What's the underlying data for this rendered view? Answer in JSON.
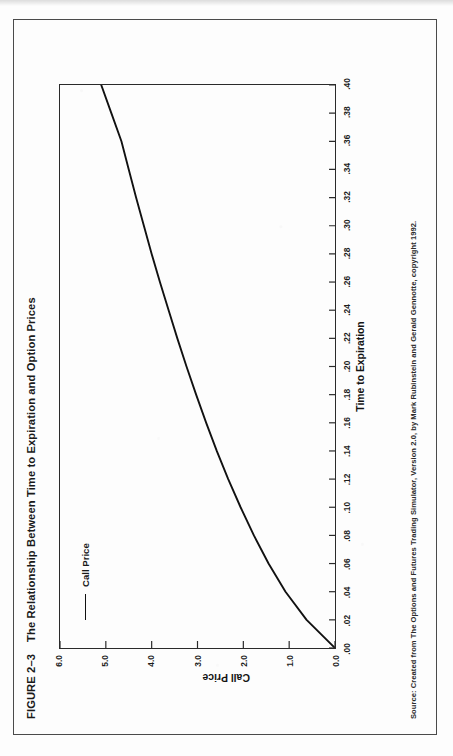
{
  "figure": {
    "number_label": "FIGURE 2–3",
    "title": "The Relationship Between Time to Expiration and Option Prices",
    "source_note": "Source: Created from The Options and Futures Trading Simulator, Version 2.0, by Mark Rubinstein and Gerald Gennotte, copyright 1992."
  },
  "colors": {
    "ink": "#1a1a1a",
    "curve": "#111111",
    "frame": "#4a4a4a",
    "axis": "#2a2a2a",
    "paper": "#fdfdfd"
  },
  "chart_data": {
    "type": "line",
    "title": "The Relationship Between Time to Expiration and Option Prices",
    "xlabel": "Time to Expiration",
    "ylabel": "Call Price",
    "xlim": [
      0.0,
      0.4
    ],
    "ylim": [
      0.0,
      6.0
    ],
    "grid": false,
    "legend_position": "upper-left",
    "xticklabels": [
      ".00",
      ".02",
      ".04",
      ".06",
      ".08",
      ".10",
      ".12",
      ".14",
      ".16",
      ".18",
      ".20",
      ".22",
      ".24",
      ".26",
      ".28",
      ".30",
      ".32",
      ".34",
      ".36",
      ".38",
      ".40"
    ],
    "xtickvalues": [
      0.0,
      0.02,
      0.04,
      0.06,
      0.08,
      0.1,
      0.12,
      0.14,
      0.16,
      0.18,
      0.2,
      0.22,
      0.24,
      0.26,
      0.28,
      0.3,
      0.32,
      0.34,
      0.36,
      0.38,
      0.4
    ],
    "yticklabels": [
      "0.0",
      "1.0",
      "2.0",
      "3.0",
      "4.0",
      "5.0",
      "6.0"
    ],
    "ytickvalues": [
      0.0,
      1.0,
      2.0,
      3.0,
      4.0,
      5.0,
      6.0
    ],
    "series": [
      {
        "name": "Call Price",
        "x": [
          0.0,
          0.02,
          0.04,
          0.06,
          0.08,
          0.1,
          0.12,
          0.14,
          0.16,
          0.18,
          0.2,
          0.22,
          0.24,
          0.26,
          0.28,
          0.3,
          0.32,
          0.34,
          0.36,
          0.38,
          0.4
        ],
        "y": [
          0.0,
          0.62,
          1.08,
          1.45,
          1.77,
          2.06,
          2.33,
          2.58,
          2.81,
          3.03,
          3.24,
          3.44,
          3.63,
          3.82,
          4.0,
          4.17,
          4.34,
          4.5,
          4.66,
          4.88,
          5.1
        ]
      }
    ],
    "legend": [
      {
        "label": "Call Price"
      }
    ]
  }
}
